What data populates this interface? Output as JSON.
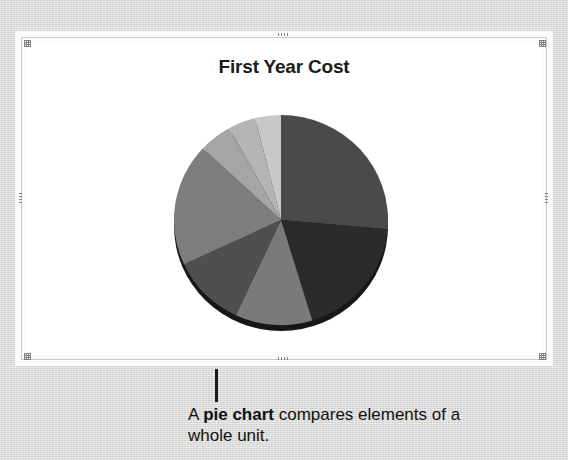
{
  "background": {
    "color": "#d6d6d4"
  },
  "slide": {
    "frame_color": "#fbfbfa",
    "canvas_color": "#ffffff",
    "border_color": "#c9c9c7",
    "handles": [
      {
        "name": "handle-top-left",
        "kind": "corner"
      },
      {
        "name": "handle-top-center",
        "kind": "horiz"
      },
      {
        "name": "handle-top-right",
        "kind": "corner"
      },
      {
        "name": "handle-middle-left",
        "kind": "vert"
      },
      {
        "name": "handle-middle-right",
        "kind": "vert"
      },
      {
        "name": "handle-bottom-left",
        "kind": "corner"
      },
      {
        "name": "handle-bottom-center",
        "kind": "horiz"
      },
      {
        "name": "handle-bottom-right",
        "kind": "corner"
      }
    ]
  },
  "callout": {
    "text_prefix": "A ",
    "text_bold": "pie chart",
    "text_suffix": " compares elements of a whole unit.",
    "leader_color": "#1b1b1b"
  },
  "chart_data": {
    "type": "pie",
    "title": "First Year Cost",
    "xlabel": "",
    "ylabel": "",
    "legend": "none",
    "grid": false,
    "start_angle_deg": 0,
    "direction": "clockwise",
    "units": "percent",
    "categories": [
      "Segment 1",
      "Segment 2",
      "Segment 3",
      "Segment 4",
      "Segment 5",
      "Segment 6",
      "Segment 7",
      "Segment 8"
    ],
    "values": [
      26.4,
      18.9,
      11.7,
      11.1,
      18.9,
      5.0,
      4.2,
      3.8
    ],
    "angles_deg": [
      95,
      68,
      42,
      40,
      68,
      18,
      15,
      14
    ],
    "colors": [
      "#4a4a4a",
      "#2b2b2b",
      "#7a7a7a",
      "#4f4f4f",
      "#7d7d7d",
      "#a5a5a5",
      "#b4b4b4",
      "#c8c8c8"
    ],
    "depth_shadow_color": "#171717"
  }
}
